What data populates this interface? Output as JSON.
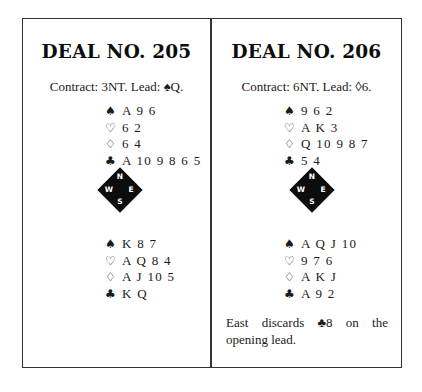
{
  "deals": [
    {
      "title": "DEAL NO. 205",
      "contract": "Contract: 3NT. Lead: ♠Q.",
      "north": [
        {
          "suit": "♠",
          "suit_name": "spades",
          "cards": "A 9 6"
        },
        {
          "suit": "♡",
          "suit_name": "hearts",
          "cards": "6 2"
        },
        {
          "suit": "♢",
          "suit_name": "diamonds",
          "cards": "6 4"
        },
        {
          "suit": "♣",
          "suit_name": "clubs",
          "cards": "A 10 9 8 6 5"
        }
      ],
      "compass": {
        "n": "N",
        "s": "S",
        "e": "E",
        "w": "W"
      },
      "south": [
        {
          "suit": "♠",
          "suit_name": "spades",
          "cards": "K 8 7"
        },
        {
          "suit": "♡",
          "suit_name": "hearts",
          "cards": "A Q 8 4"
        },
        {
          "suit": "♢",
          "suit_name": "diamonds",
          "cards": "A J 10 5"
        },
        {
          "suit": "♣",
          "suit_name": "clubs",
          "cards": "K Q"
        }
      ]
    },
    {
      "title": "DEAL NO. 206",
      "contract": "Contract: 6NT. Lead: ◊6.",
      "north": [
        {
          "suit": "♠",
          "suit_name": "spades",
          "cards": "9 6 2"
        },
        {
          "suit": "♡",
          "suit_name": "hearts",
          "cards": "A K 3"
        },
        {
          "suit": "♢",
          "suit_name": "diamonds",
          "cards": "Q 10 9 8 7"
        },
        {
          "suit": "♣",
          "suit_name": "clubs",
          "cards": "5 4"
        }
      ],
      "compass": {
        "n": "N",
        "s": "S",
        "e": "E",
        "w": "W"
      },
      "south": [
        {
          "suit": "♠",
          "suit_name": "spades",
          "cards": "A Q J 10"
        },
        {
          "suit": "♡",
          "suit_name": "hearts",
          "cards": "9 7 6"
        },
        {
          "suit": "♢",
          "suit_name": "diamonds",
          "cards": "A K J"
        },
        {
          "suit": "♣",
          "suit_name": "clubs",
          "cards": "A 9 2"
        }
      ],
      "note": {
        "line1_words": [
          "East",
          "discards",
          "♣8",
          "on",
          "the"
        ],
        "line2": "opening lead."
      }
    }
  ]
}
